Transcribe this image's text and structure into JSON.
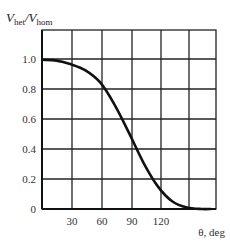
{
  "chart_data": {
    "type": "line",
    "title": "",
    "xlabel": "θ, deg",
    "ylabel": "V_het/V_hom",
    "ylabel_main1": "V",
    "ylabel_sub1": "het",
    "ylabel_slash": "/",
    "ylabel_main2": "V",
    "ylabel_sub2": "hom",
    "xlim": [
      0,
      180
    ],
    "ylim": [
      0,
      1.2
    ],
    "grid": true,
    "x_ticks": [
      "30",
      "60",
      "90",
      "120"
    ],
    "y_ticks": [
      "0",
      "0.2",
      "0.4",
      "0.6",
      "0.8",
      "1.0"
    ],
    "series": [
      {
        "name": "V_het/V_hom",
        "x": [
          0,
          15,
          30,
          45,
          60,
          75,
          90,
          105,
          120,
          135,
          150,
          165,
          175
        ],
        "y": [
          1.0,
          0.995,
          0.97,
          0.93,
          0.85,
          0.7,
          0.51,
          0.31,
          0.15,
          0.05,
          0.01,
          0.0,
          0.0
        ]
      }
    ]
  }
}
